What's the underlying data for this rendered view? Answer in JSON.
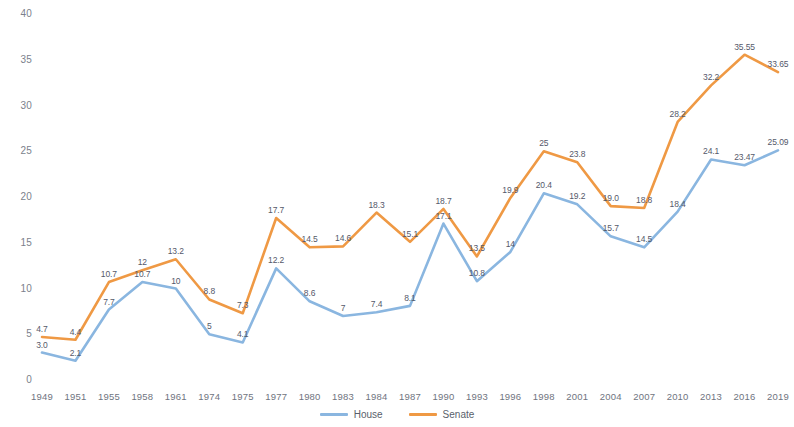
{
  "chart_data": {
    "type": "line",
    "title": "",
    "subtitle": "",
    "xlabel": "",
    "ylabel": "",
    "ylim": [
      0,
      40
    ],
    "ytick_values": [
      0,
      5,
      10,
      15,
      20,
      25,
      30,
      35,
      40
    ],
    "ytick_labels": [
      "0",
      "5",
      "10",
      "15",
      "20",
      "25",
      "30",
      "35",
      "40"
    ],
    "grid": false,
    "legend_position": "bottom-center",
    "categories": [
      "1949",
      "1951",
      "1955",
      "1958",
      "1961",
      "1974",
      "1975",
      "1977",
      "1980",
      "1983",
      "1984",
      "1987",
      "1990",
      "1993",
      "1996",
      "1998",
      "2001",
      "2004",
      "2007",
      "2010",
      "2013",
      "2016",
      "2019"
    ],
    "series": [
      {
        "name": "House",
        "color": "#8ab6e0",
        "values": [
          3.0,
          2.1,
          7.7,
          10.7,
          10,
          5,
          4.1,
          12.2,
          8.6,
          7,
          7.4,
          8.1,
          17.1,
          10.8,
          14,
          20.4,
          19.2,
          15.7,
          14.5,
          18.4,
          24.1,
          23.47,
          25.09
        ],
        "labels": [
          "3.0",
          "2.1",
          "7.7",
          "10.7",
          "10",
          "5",
          "4.1",
          "12.2",
          "8.6",
          "7",
          "7.4",
          "8.1",
          "17.1",
          "10.8",
          "14",
          "20.4",
          "19.2",
          "15.7",
          "14.5",
          "18.4",
          "24.1",
          "23.47",
          "25.09"
        ]
      },
      {
        "name": "Senate",
        "color": "#ef9944",
        "values": [
          4.7,
          4.4,
          10.7,
          12,
          13.2,
          8.8,
          7.3,
          17.7,
          14.5,
          14.6,
          18.3,
          15.1,
          18.7,
          13.5,
          19.9,
          25,
          23.8,
          19.0,
          18.8,
          28.2,
          32.2,
          35.55,
          33.65
        ],
        "labels": [
          "4.7",
          "4.4",
          "10.7",
          "12",
          "13.2",
          "8.8",
          "7.3",
          "17.7",
          "14.5",
          "14.6",
          "18.3",
          "15.1",
          "18.7",
          "13.5",
          "19.9",
          "25",
          "23.8",
          "19.0",
          "18.8",
          "28.2",
          "32.2",
          "35.55",
          "33.65"
        ]
      }
    ]
  },
  "legend": {
    "items": [
      {
        "label": "House",
        "color": "#8ab6e0"
      },
      {
        "label": "Senate",
        "color": "#ef9944"
      }
    ]
  }
}
